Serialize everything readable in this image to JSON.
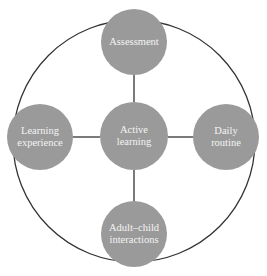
{
  "diagram": {
    "type": "hub-and-spoke within enclosing circle",
    "colors": {
      "node_fill": "#9a9a9a",
      "line": "#333333",
      "text": "#f4f4f4",
      "background": "#ffffff"
    },
    "center": {
      "label": "Active\nlearning",
      "line1": "Active",
      "line2": "learning"
    },
    "nodes": [
      {
        "position": "top",
        "line1": "Assessment",
        "line2": ""
      },
      {
        "position": "left",
        "line1": "Learning",
        "line2": "experience"
      },
      {
        "position": "right",
        "line1": "Daily",
        "line2": "routine"
      },
      {
        "position": "bottom",
        "line1": "Adult–child",
        "line2": "interactions"
      }
    ]
  }
}
